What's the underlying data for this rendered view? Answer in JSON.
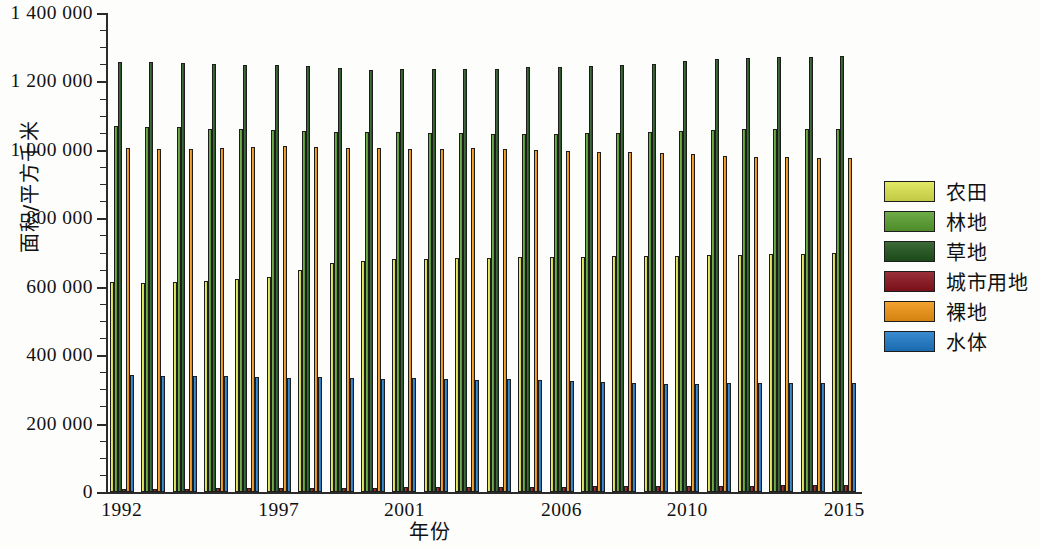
{
  "chart_data": {
    "type": "bar",
    "title": "",
    "xlabel": "年份",
    "ylabel": "面积/平方千米",
    "ylim": [
      0,
      1400000
    ],
    "ytick_labels": [
      "0",
      "200 000",
      "400 000",
      "600 000",
      "800 000",
      "1 000 000",
      "1 200 000",
      "1 400 000"
    ],
    "ytick_values": [
      0,
      200000,
      400000,
      600000,
      800000,
      1000000,
      1200000,
      1400000
    ],
    "minor_tick_step": 50000,
    "grid": false,
    "legend_position": "right",
    "categories": [
      "1992",
      "1993",
      "1994",
      "1995",
      "1996",
      "1997",
      "1998",
      "1999",
      "2000",
      "2001",
      "2002",
      "2003",
      "2004",
      "2005",
      "2006",
      "2007",
      "2008",
      "2009",
      "2010",
      "2011",
      "2012",
      "2013",
      "2014",
      "2015"
    ],
    "xtick_labels": [
      "1992",
      "1997",
      "2001",
      "2006",
      "2010",
      "2015"
    ],
    "xtick_categories": [
      "1992",
      "1997",
      "2001",
      "2006",
      "2010",
      "2015"
    ],
    "series": [
      {
        "name": "农田",
        "color": "#d2da55",
        "values": [
          615000,
          612000,
          615000,
          618000,
          622000,
          627000,
          648000,
          668000,
          675000,
          680000,
          682000,
          683000,
          684000,
          687000,
          687000,
          688000,
          689000,
          690000,
          691000,
          692000,
          693000,
          695000,
          696000,
          699000
        ]
      },
      {
        "name": "林地",
        "color": "#5e9b39",
        "values": [
          1069000,
          1068000,
          1066000,
          1062000,
          1060000,
          1058000,
          1055000,
          1053000,
          1052000,
          1051000,
          1049000,
          1048000,
          1047000,
          1046000,
          1046000,
          1048000,
          1049000,
          1052000,
          1056000,
          1058000,
          1060000,
          1060000,
          1061000,
          1062000
        ]
      },
      {
        "name": "草地",
        "color": "#2c5b29",
        "values": [
          1258000,
          1256000,
          1253000,
          1251000,
          1249000,
          1247000,
          1245000,
          1238000,
          1234000,
          1235000,
          1236000,
          1235000,
          1237000,
          1242000,
          1243000,
          1244000,
          1247000,
          1252000,
          1261000,
          1265000,
          1269000,
          1270000,
          1271000,
          1275000
        ]
      },
      {
        "name": "城市用地",
        "color": "#8a2029",
        "values": [
          9000,
          9500,
          10000,
          10500,
          11000,
          11500,
          12000,
          12500,
          13000,
          13500,
          14000,
          14500,
          15000,
          15500,
          16000,
          16500,
          17000,
          17500,
          18000,
          18500,
          19000,
          19500,
          20000,
          20500
        ]
      },
      {
        "name": "裸地",
        "color": "#e59320",
        "values": [
          1006000,
          1004000,
          1004000,
          1005000,
          1009000,
          1010000,
          1008000,
          1006000,
          1005000,
          1004000,
          1004000,
          1006000,
          1003000,
          1000000,
          997000,
          995000,
          993000,
          991000,
          987000,
          983000,
          980000,
          979000,
          977000,
          976000
        ]
      },
      {
        "name": "水体",
        "color": "#2a7bbf",
        "values": [
          341000,
          339000,
          339000,
          338000,
          336000,
          334000,
          335000,
          333000,
          331000,
          333000,
          330000,
          328000,
          330000,
          327000,
          324000,
          322000,
          319000,
          316000,
          317000,
          320000,
          318000,
          319000,
          318000,
          320000
        ]
      }
    ]
  },
  "legend": {
    "items": [
      {
        "label": "农田",
        "color": "#d2da55"
      },
      {
        "label": "林地",
        "color": "#5e9b39"
      },
      {
        "label": "草地",
        "color": "#2c5b29"
      },
      {
        "label": "城市用地",
        "color": "#8a2029"
      },
      {
        "label": "裸地",
        "color": "#e59320"
      },
      {
        "label": "水体",
        "color": "#2a7bbf"
      }
    ]
  }
}
